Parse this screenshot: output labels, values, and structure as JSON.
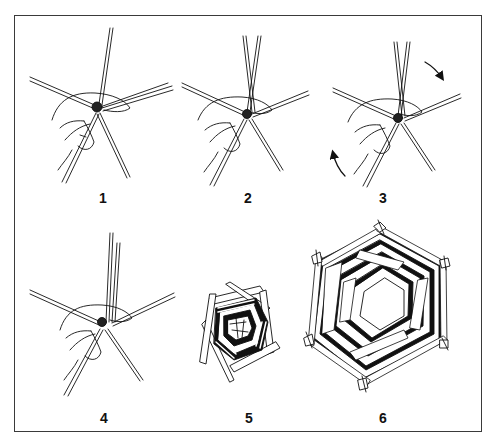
{
  "diagram": {
    "steps": [
      {
        "label": "1",
        "content": "hand holding crossed strips at center, six strips radiating"
      },
      {
        "label": "2",
        "content": "two strips raised upward, crossing, held in hand"
      },
      {
        "label": "3",
        "content": "strips held with rotation arrows indicating turning"
      },
      {
        "label": "4",
        "content": "two parallel strips upright, hand holding center"
      },
      {
        "label": "5",
        "content": "small woven spiral of strips"
      },
      {
        "label": "6",
        "content": "completed hexagonal woven frame with open center"
      }
    ],
    "rotation_arrows": [
      "clockwise-arrow-top-right",
      "clockwise-arrow-bottom-left"
    ],
    "colors": {
      "ink": "#111111",
      "paper": "#ffffff",
      "frame": "#3a3a3a"
    }
  }
}
